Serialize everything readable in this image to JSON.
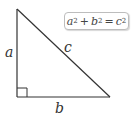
{
  "diagram": {
    "type": "right-triangle",
    "labels": {
      "leg_vertical": "a",
      "leg_horizontal": "b",
      "hypotenuse": "c"
    },
    "formula": {
      "term1": "a",
      "term2": "b",
      "result": "c",
      "exponent": "2",
      "plus": "+",
      "equals": "="
    },
    "colors": {
      "stroke": "#333333",
      "box_border": "#bdbdbd"
    }
  }
}
